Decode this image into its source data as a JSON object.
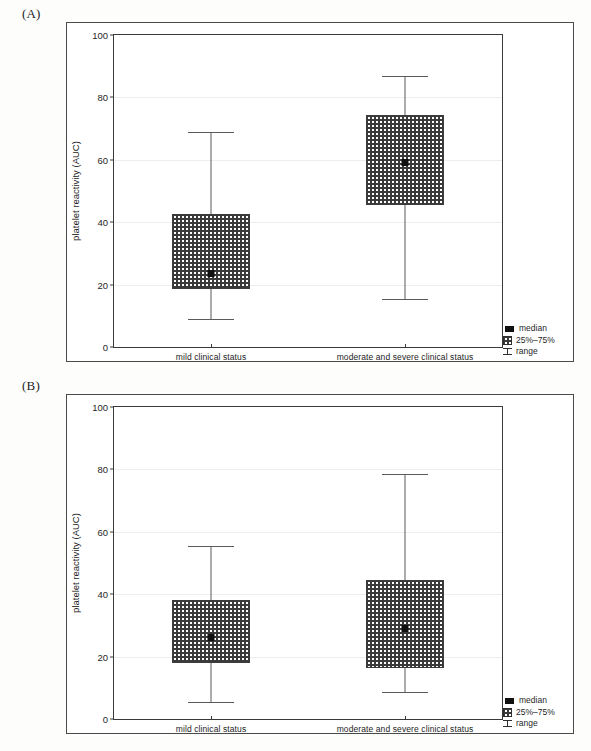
{
  "figure": {
    "panels": [
      {
        "letter": "(A)",
        "ylabel": "platelet reactivity (AUC)",
        "yticks": [
          "0",
          "20",
          "40",
          "60",
          "80",
          "100"
        ],
        "categories": [
          "mild clinical status",
          "moderate and severe clinical status"
        ],
        "legend": {
          "median": "median",
          "iqr": "25%–75%",
          "range": "range"
        }
      },
      {
        "letter": "(B)",
        "ylabel": "platelet reactivity (AUC)",
        "yticks": [
          "0",
          "20",
          "40",
          "60",
          "80",
          "100"
        ],
        "categories": [
          "mild clinical status",
          "moderate and severe clinical status"
        ],
        "legend": {
          "median": "median",
          "iqr": "25%–75%",
          "range": "range"
        }
      }
    ]
  },
  "chart_data": [
    {
      "type": "box",
      "panel": "(A)",
      "title": "",
      "xlabel": "",
      "ylabel": "platelet reactivity (AUC)",
      "ylim": [
        0,
        100
      ],
      "ytick_values": [
        0,
        20,
        40,
        60,
        80,
        100
      ],
      "grid": true,
      "legend_position": "bottom-right",
      "legend_entries": [
        "median",
        "25%–75%",
        "range"
      ],
      "categories": [
        "mild clinical status",
        "moderate and severe clinical status"
      ],
      "boxes": [
        {
          "category": "mild clinical status",
          "min": 9.0,
          "q1": 18.5,
          "median": 23.5,
          "q3": 42.5,
          "max": 69.0
        },
        {
          "category": "moderate and severe clinical status",
          "min": 15.5,
          "q1": 45.5,
          "median": 59.0,
          "q3": 74.5,
          "max": 87.0
        }
      ]
    },
    {
      "type": "box",
      "panel": "(B)",
      "title": "",
      "xlabel": "",
      "ylabel": "platelet reactivity (AUC)",
      "ylim": [
        0,
        100
      ],
      "ytick_values": [
        0,
        20,
        40,
        60,
        80,
        100
      ],
      "grid": true,
      "legend_position": "bottom-right",
      "legend_entries": [
        "median",
        "25%–75%",
        "range"
      ],
      "categories": [
        "mild clinical status",
        "moderate and severe clinical status"
      ],
      "boxes": [
        {
          "category": "mild clinical status",
          "min": 5.5,
          "q1": 18.0,
          "median": 26.0,
          "q3": 38.0,
          "max": 55.5
        },
        {
          "category": "moderate and severe clinical status",
          "min": 8.5,
          "q1": 16.5,
          "median": 29.0,
          "q3": 44.5,
          "max": 78.5
        }
      ]
    }
  ],
  "style": {
    "box_fill": "#3a3a3a",
    "line_color": "#4a4a4a",
    "median_color": "#111111",
    "background": "#ffffff"
  }
}
